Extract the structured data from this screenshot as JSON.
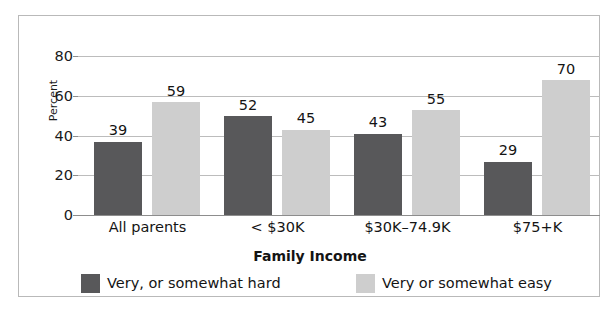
{
  "chart_data": {
    "type": "bar",
    "title": "",
    "subtitle": "",
    "xlabel": "Family Income",
    "ylabel": "Percent",
    "categories": [
      "All parents",
      "< $30K",
      "$30K–74.9K",
      "$75+K"
    ],
    "series": [
      {
        "name": "Very, or somewhat hard",
        "color": "#58585a",
        "values": [
          39,
          52,
          43,
          29
        ]
      },
      {
        "name": "Very or somewhat easy",
        "color": "#cecece",
        "values": [
          59,
          45,
          55,
          70
        ]
      }
    ],
    "ylim": [
      0,
      80
    ],
    "yticks": [
      0,
      20,
      40,
      60,
      80
    ],
    "ytick_labels": [
      "0",
      "20",
      "40",
      "60",
      "80"
    ],
    "grid": "horizontal",
    "legend_position": "bottom",
    "data_labels": true,
    "frame_color": "#b9b9b9",
    "gridline_color": "#bcbcbc",
    "background": "#ffffff"
  },
  "legend": {
    "items": [
      {
        "label": "Very, or somewhat hard",
        "swatch": "hard"
      },
      {
        "label": "Very or somewhat easy",
        "swatch": "easy"
      }
    ]
  }
}
